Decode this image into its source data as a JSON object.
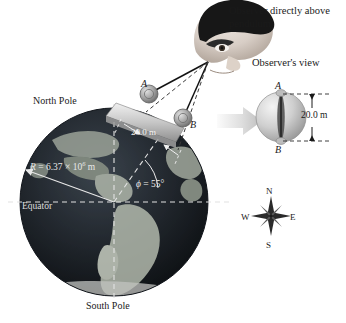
{
  "figure": {
    "observer_caption": "Observer directly above pendulum",
    "observers_view_caption": "Observer's view"
  },
  "globe": {
    "north_pole_label": "North Pole",
    "south_pole_label": "South Pole",
    "equator_label": "Equator",
    "radius_label_prefix": "R",
    "radius_equals": "=",
    "radius_value": "6.37",
    "radius_times": "×",
    "radius_mantissa": "10",
    "radius_exponent": "6",
    "radius_unit": "m",
    "latitude_symbol": "ϕ",
    "latitude_equals": "=",
    "latitude_value": "55°",
    "arc_length_label": "20.0 m"
  },
  "pendulum": {
    "bob_a_label": "A",
    "bob_b_label": "B"
  },
  "observers_view": {
    "top_label": "A",
    "bottom_label": "B",
    "dimension_label": "20.0 m"
  },
  "compass": {
    "north": "N",
    "east": "E",
    "south": "S",
    "west": "W"
  },
  "colors": {
    "background": "#ffffff",
    "globe_dark": "#1b1f24",
    "globe_land": "#b9bdb4",
    "dashed_light": "#e6e6e6",
    "ink": "#1a1a1a",
    "bob_gray": "#9a9a9a",
    "arrow_gray": "#d2d2d2",
    "band_gray": "#c9c9c9"
  }
}
